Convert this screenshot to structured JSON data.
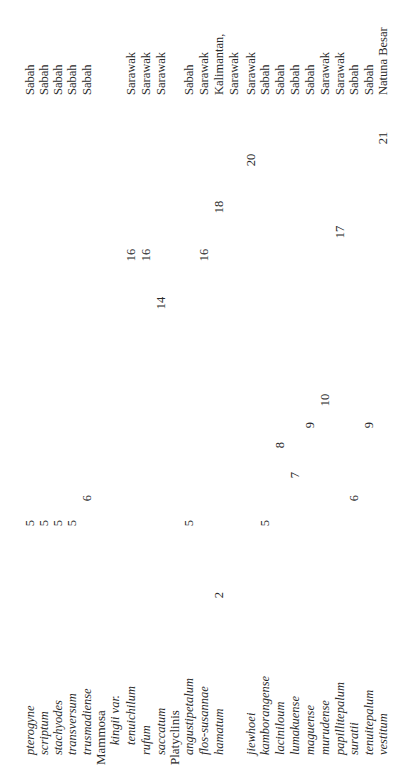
{
  "table": {
    "rows": [
      {
        "name": "pterogyne",
        "type": "species",
        "indent": 1,
        "y": 23,
        "values": [
          {
            "v": "5",
            "x": 250
          }
        ],
        "region": "Sabah"
      },
      {
        "name": "scriptum",
        "type": "species",
        "indent": 1,
        "y": 37,
        "values": [
          {
            "v": "5",
            "x": 250
          }
        ],
        "region": "Sabah"
      },
      {
        "name": "stachyodes",
        "type": "species",
        "indent": 1,
        "y": 51,
        "values": [
          {
            "v": "5",
            "x": 250
          }
        ],
        "region": "Sabah"
      },
      {
        "name": "transversum",
        "type": "species",
        "indent": 1,
        "y": 65,
        "values": [
          {
            "v": "5",
            "x": 250
          }
        ],
        "region": "Sabah"
      },
      {
        "name": "trusmadiense",
        "type": "species",
        "indent": 1,
        "y": 80,
        "values": [
          {
            "v": "6",
            "x": 275
          }
        ],
        "region": "Sabah"
      },
      {
        "name": "Mammosa",
        "type": "section",
        "indent": 0,
        "y": 94,
        "values": [],
        "region": ""
      },
      {
        "name": "kingii var.",
        "type": "species",
        "indent": 2,
        "y": 108,
        "values": [],
        "region": ""
      },
      {
        "name": "tenuichilum",
        "type": "species",
        "indent": 2,
        "y": 124,
        "values": [
          {
            "v": "16",
            "x": 518
          }
        ],
        "region": "Sarawak"
      },
      {
        "name": "rufum",
        "type": "species",
        "indent": 1,
        "y": 139,
        "values": [
          {
            "v": "16",
            "x": 518
          }
        ],
        "region": "Sarawak"
      },
      {
        "name": "saccatum",
        "type": "species",
        "indent": 1,
        "y": 154,
        "values": [
          {
            "v": "14",
            "x": 470
          }
        ],
        "region": "Sarawak"
      },
      {
        "name": "Platyclinis",
        "type": "section",
        "indent": 0,
        "y": 168,
        "values": [],
        "region": ""
      },
      {
        "name": "angustipetalum",
        "type": "species",
        "indent": 1,
        "y": 182,
        "values": [
          {
            "v": "5",
            "x": 250
          }
        ],
        "region": "Sabah"
      },
      {
        "name": "flos-susannae",
        "type": "species",
        "indent": 1,
        "y": 197,
        "values": [
          {
            "v": "16",
            "x": 518
          }
        ],
        "region": "Sarawak"
      },
      {
        "name": "hamatum",
        "type": "species",
        "indent": 1,
        "y": 212,
        "values": [
          {
            "v": "2",
            "x": 178
          },
          {
            "v": "18",
            "x": 566
          }
        ],
        "region": "Kalimantan,"
      },
      {
        "name": "",
        "type": "species",
        "indent": 1,
        "y": 227,
        "values": [],
        "region": "Sarawak"
      },
      {
        "name": "jiewhoei",
        "type": "species",
        "indent": 1,
        "y": 244,
        "values": [
          {
            "v": "20",
            "x": 613
          }
        ],
        "region": "Sarawak"
      },
      {
        "name": "kamborangense",
        "type": "species",
        "indent": 1,
        "y": 258,
        "values": [
          {
            "v": "5",
            "x": 250
          }
        ],
        "region": "Sabah"
      },
      {
        "name": "laciniloum",
        "type": "species",
        "indent": 1,
        "y": 273,
        "values": [
          {
            "v": "8",
            "x": 328
          }
        ],
        "region": "Sabah"
      },
      {
        "name": "lumakuense",
        "type": "species",
        "indent": 1,
        "y": 288,
        "values": [
          {
            "v": "7",
            "x": 298
          }
        ],
        "region": "Sabah"
      },
      {
        "name": "maguense",
        "type": "species",
        "indent": 1,
        "y": 303,
        "values": [
          {
            "v": "9",
            "x": 348
          }
        ],
        "region": "Sabah"
      },
      {
        "name": "murudense",
        "type": "species",
        "indent": 1,
        "y": 318,
        "values": [
          {
            "v": "10",
            "x": 373
          }
        ],
        "region": "Sarawak"
      },
      {
        "name": "papillitepalum",
        "type": "species",
        "indent": 1,
        "y": 333,
        "values": [
          {
            "v": "17",
            "x": 541
          }
        ],
        "region": "Sarawak"
      },
      {
        "name": "suratii",
        "type": "species",
        "indent": 1,
        "y": 347,
        "values": [
          {
            "v": "6",
            "x": 275
          }
        ],
        "region": "Sabah"
      },
      {
        "name": "tenuitepalum",
        "type": "species",
        "indent": 1,
        "y": 362,
        "values": [
          {
            "v": "9",
            "x": 348
          }
        ],
        "region": "Sabah"
      },
      {
        "name": "vestitum",
        "type": "species",
        "indent": 1,
        "y": 376,
        "values": [
          {
            "v": "21",
            "x": 635
          }
        ],
        "region": "Natuna Besar"
      }
    ]
  }
}
